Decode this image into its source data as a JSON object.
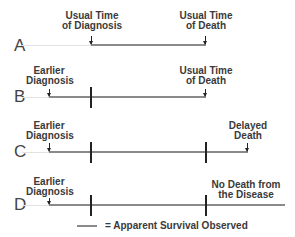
{
  "rows": [
    {
      "letter": "A",
      "labels": {
        "diagnosis": [
          "Usual Time",
          "of Diagnosis"
        ],
        "end": [
          "Usual Time",
          "of Death"
        ]
      }
    },
    {
      "letter": "B",
      "labels": {
        "diagnosis": [
          "Earlier",
          "Diagnosis"
        ],
        "end": [
          "Usual Time",
          "of Death"
        ]
      }
    },
    {
      "letter": "C",
      "labels": {
        "diagnosis": [
          "Earlier",
          "Diagnosis"
        ],
        "end": [
          "Delayed",
          "Death"
        ]
      }
    },
    {
      "letter": "D",
      "labels": {
        "diagnosis": [
          "Earlier",
          "Diagnosis"
        ],
        "end": [
          "No Death from",
          "the Disease"
        ]
      }
    }
  ],
  "legend": {
    "text": "= Apparent Survival Observed"
  },
  "colors": {
    "survival_line": "#8a8a8a",
    "baseline": "#e2e2e2",
    "markers": "#222222"
  }
}
